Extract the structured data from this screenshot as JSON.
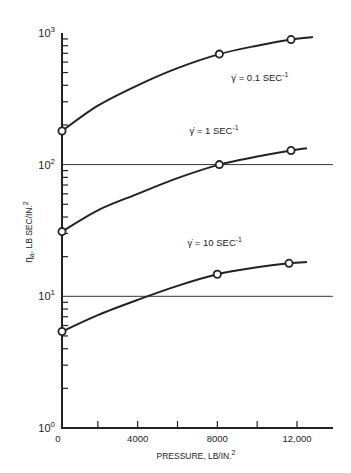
{
  "chart_data": {
    "type": "line",
    "title": "",
    "xlabel": "PRESSURE, LB/IN.²",
    "ylabel": "ηa , LB SEC/IN.²",
    "xlim": [
      0,
      14000
    ],
    "ylim": [
      1,
      1000
    ],
    "yscale": "log",
    "grid": false,
    "x_ticks": [
      0,
      2000,
      4000,
      6000,
      8000,
      10000,
      12000
    ],
    "x_tick_labels": [
      {
        "value": 0,
        "label": "0"
      },
      {
        "value": 4000,
        "label": "4000"
      },
      {
        "value": 8000,
        "label": "8000"
      },
      {
        "value": 12000,
        "label": "12,000"
      }
    ],
    "y_tick_labels": [
      {
        "value": 1,
        "base": "10",
        "exp": "0"
      },
      {
        "value": 10,
        "base": "10",
        "exp": "1"
      },
      {
        "value": 100,
        "base": "10",
        "exp": "2"
      },
      {
        "value": 1000,
        "base": "10",
        "exp": "3"
      }
    ],
    "reference_lines": [
      {
        "y": 100,
        "x_from": 0,
        "x_to": 13800
      },
      {
        "y": 10,
        "x_from": 0,
        "x_to": 13800
      }
    ],
    "series": [
      {
        "name": "γ = 0.1 SEC⁻¹",
        "label_text": "γ̇ = 0.1 SEC",
        "label_exp": "-1",
        "label_pos": {
          "x": 8700,
          "y": 430
        },
        "markers": [
          {
            "x": 0,
            "y": 180
          },
          {
            "x": 8100,
            "y": 690
          },
          {
            "x": 11700,
            "y": 890
          }
        ],
        "curve": [
          {
            "x": 0,
            "y": 180
          },
          {
            "x": 2000,
            "y": 280
          },
          {
            "x": 4000,
            "y": 400
          },
          {
            "x": 6000,
            "y": 540
          },
          {
            "x": 8100,
            "y": 690
          },
          {
            "x": 10000,
            "y": 800
          },
          {
            "x": 11700,
            "y": 890
          },
          {
            "x": 12800,
            "y": 930
          }
        ]
      },
      {
        "name": "γ = 1 SEC⁻¹",
        "label_text": "γ̇ = 1 SEC",
        "label_exp": "-1",
        "label_pos": {
          "x": 6600,
          "y": 170
        },
        "markers": [
          {
            "x": 0,
            "y": 31
          },
          {
            "x": 8100,
            "y": 100
          },
          {
            "x": 11700,
            "y": 128
          }
        ],
        "curve": [
          {
            "x": 0,
            "y": 31
          },
          {
            "x": 2000,
            "y": 45
          },
          {
            "x": 4000,
            "y": 60
          },
          {
            "x": 6000,
            "y": 79
          },
          {
            "x": 8100,
            "y": 100
          },
          {
            "x": 10000,
            "y": 115
          },
          {
            "x": 11700,
            "y": 128
          },
          {
            "x": 12500,
            "y": 133
          }
        ]
      },
      {
        "name": "γ = 10 SEC⁻¹",
        "label_text": "γ̇ = 10 SEC",
        "label_exp": "-1",
        "label_pos": {
          "x": 6500,
          "y": 24
        },
        "markers": [
          {
            "x": 0,
            "y": 5.4
          },
          {
            "x": 8000,
            "y": 14.7
          },
          {
            "x": 11600,
            "y": 17.8
          }
        ],
        "curve": [
          {
            "x": 0,
            "y": 5.4
          },
          {
            "x": 2000,
            "y": 7.2
          },
          {
            "x": 4000,
            "y": 9.4
          },
          {
            "x": 6000,
            "y": 12.0
          },
          {
            "x": 8000,
            "y": 14.7
          },
          {
            "x": 10000,
            "y": 16.6
          },
          {
            "x": 11600,
            "y": 17.8
          },
          {
            "x": 12500,
            "y": 18.2
          }
        ]
      }
    ]
  },
  "axes": {
    "x_title": "PRESSURE, LB/IN.",
    "x_title_sup": "2",
    "y_title": "η",
    "y_title_sub": "a",
    "y_title_rest": ", LB SEC/IN.",
    "y_title_sup": "2"
  }
}
